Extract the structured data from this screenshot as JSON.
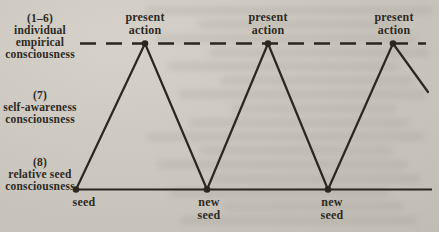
{
  "figure": {
    "left_labels": [
      {
        "lines": [
          "(1–6)",
          "individual",
          "empirical",
          "consciousness"
        ]
      },
      {
        "lines": [
          "(7)",
          "self-awareness",
          "consciousness"
        ]
      },
      {
        "lines": [
          "(8)",
          "relative seed",
          "consciousness"
        ]
      }
    ],
    "peak_labels": [
      {
        "lines": [
          "present",
          "action"
        ]
      },
      {
        "lines": [
          "present",
          "action"
        ]
      },
      {
        "lines": [
          "present",
          "action"
        ]
      }
    ],
    "base_labels": [
      {
        "lines": [
          "seed"
        ]
      },
      {
        "lines": [
          "new",
          "seed"
        ]
      },
      {
        "lines": [
          "new",
          "seed"
        ]
      }
    ],
    "colors": {
      "ink": "#2e2a23",
      "paper": "#cac6be"
    }
  }
}
